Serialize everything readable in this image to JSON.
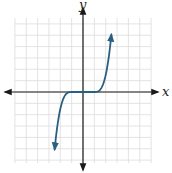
{
  "chart_data": {
    "type": "line",
    "title": "",
    "xlabel": "x",
    "ylabel": "y",
    "xlim": [
      -6,
      6
    ],
    "ylim": [
      -6,
      6
    ],
    "grid": true,
    "grid_step": 1,
    "tick_labels": false,
    "axis_arrows": true,
    "series": [
      {
        "name": "piecewise cubic",
        "description": "y = 1.5(x+1)^3 for x < -1; y = 0 for -1 <= x <= 1; y = 1.5(x-1)^3 for x > 1",
        "x_range": [
          -2.5,
          2.5
        ],
        "flat_interval": [
          -1,
          1
        ],
        "coefficient": 1.5,
        "endpoint_arrows": true,
        "color": "#2b5f80"
      }
    ]
  },
  "labels": {
    "x_axis": "x",
    "y_axis": "y"
  }
}
